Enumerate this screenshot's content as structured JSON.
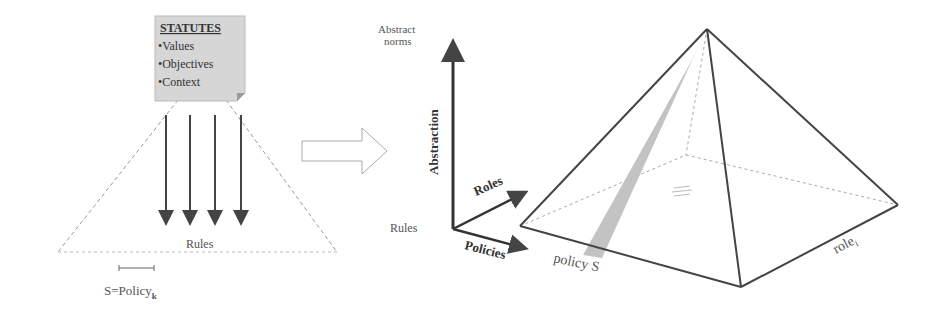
{
  "left_panel": {
    "note": {
      "title": "STATUTES",
      "items": [
        "•Values",
        "•Objectives",
        "•Context"
      ],
      "fill": "#d6d6d6"
    },
    "rules_label": "Rules",
    "scale_label_main": "S=Policy",
    "scale_label_sub": "k",
    "arrow_count": 4
  },
  "transition_arrow": {
    "type": "hollow-right-arrow"
  },
  "right_panel": {
    "axes": {
      "vertical_label": "Abstraction",
      "top_label_line1": "Abstract",
      "top_label_line2": "norms",
      "origin_label": "Rules",
      "roles_axis_label": "Roles",
      "policies_axis_label": "Policies"
    },
    "pyramid": {
      "policy_label": "policy S",
      "role_label": "role",
      "role_sub": "i",
      "slice_color": "#bdbdbd"
    }
  }
}
